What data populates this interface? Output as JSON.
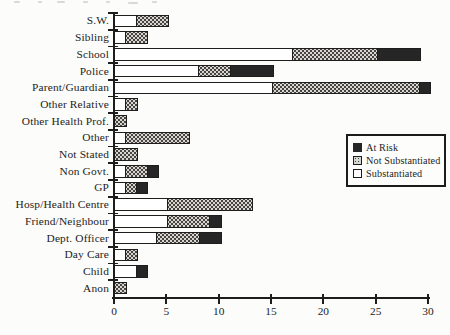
{
  "chart_data": {
    "type": "bar",
    "orientation": "horizontal",
    "stacked": true,
    "title": "",
    "xlabel": "",
    "ylabel": "",
    "xlim": [
      0,
      30
    ],
    "x_ticks": [
      0,
      5,
      10,
      15,
      20,
      25,
      30
    ],
    "grid": false,
    "categories": [
      "S.W.",
      "Sibling",
      "School",
      "Police",
      "Parent/Guardian",
      "Other Relative",
      "Other Health Prof.",
      "Other",
      "Not Stated",
      "Non Govt.",
      "GP",
      "Hosp/Health Centre",
      "Friend/Neighbour",
      "Dept. Officer",
      "Day Care",
      "Child",
      "Anon"
    ],
    "series": [
      {
        "name": "Substantiated",
        "style": "white",
        "values": [
          2,
          1,
          17,
          8,
          15,
          1,
          0,
          1,
          0,
          1,
          1,
          5,
          5,
          4,
          1,
          2,
          0
        ]
      },
      {
        "name": "Not Substantiated",
        "style": "stipple",
        "values": [
          3,
          2,
          8,
          3,
          14,
          1,
          1,
          6,
          2,
          2,
          1,
          8,
          4,
          4,
          1,
          0,
          1
        ]
      },
      {
        "name": "At Risk",
        "style": "black",
        "values": [
          0,
          0,
          4,
          4,
          1,
          0,
          0,
          0,
          0,
          1,
          1,
          0,
          1,
          2,
          0,
          1,
          0
        ]
      }
    ],
    "totals": [
      5,
      3,
      29,
      15,
      30,
      2,
      1,
      7,
      2,
      4,
      3,
      13,
      10,
      10,
      2,
      3,
      1
    ],
    "legend": {
      "position": "right-middle",
      "entries": [
        {
          "label": "At Risk",
          "style": "black"
        },
        {
          "label": "Not Substantiated",
          "style": "stipple"
        },
        {
          "label": "Substantiated",
          "style": "white"
        }
      ]
    },
    "colors": {
      "ink": "#1d1d1d",
      "at_risk_fill": "#262626",
      "not_substantiated_bg": "#d7d6d2",
      "not_substantiated_dot": "#47443f",
      "substantiated_fill": "#ffffff",
      "background": "#fcfcfa"
    }
  }
}
